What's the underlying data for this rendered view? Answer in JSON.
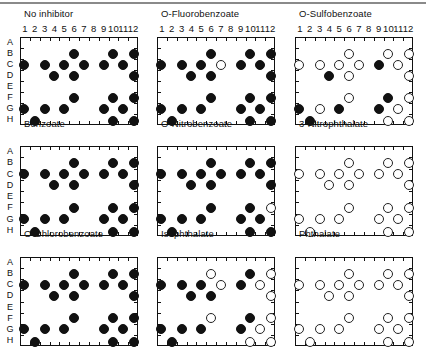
{
  "figure": {
    "rows": [
      "A",
      "B",
      "C",
      "D",
      "E",
      "F",
      "G",
      "H"
    ],
    "columns": [
      "1",
      "2",
      "3",
      "4",
      "5",
      "6",
      "7",
      "8",
      "9",
      "10",
      "11",
      "12"
    ],
    "legend": {
      "filled": "filled circle",
      "open": "open circle"
    },
    "colors": {
      "filled": "#111111",
      "open_border": "#222222",
      "background": "#ffffff"
    }
  },
  "chart_data": {
    "type": "scatter",
    "title": "",
    "xlabel": "",
    "ylabel": "",
    "x_tick_labels": [
      "1",
      "2",
      "3",
      "4",
      "5",
      "6",
      "7",
      "8",
      "9",
      "10",
      "11",
      "12"
    ],
    "y_tick_labels": [
      "A",
      "B",
      "C",
      "D",
      "E",
      "F",
      "G",
      "H"
    ],
    "grid": false,
    "wells": [
      "B6",
      "B10",
      "B12",
      "C1",
      "C3",
      "C5",
      "C7",
      "C9",
      "C11",
      "D4",
      "D6",
      "D12",
      "F6",
      "F10",
      "F12",
      "G1",
      "G3",
      "G5",
      "G9",
      "G11",
      "H2",
      "H10",
      "H12"
    ],
    "panels": [
      {
        "title": "No inhibitor",
        "show_col_labels": true,
        "show_row_labels": true,
        "filled": [
          "B6",
          "B10",
          "B12",
          "C1",
          "C3",
          "C5",
          "C7",
          "C9",
          "C11",
          "D4",
          "D6",
          "D12",
          "F6",
          "F10",
          "F12",
          "G1",
          "G3",
          "G5",
          "G9",
          "G11",
          "H2",
          "H10",
          "H12"
        ],
        "open": []
      },
      {
        "title": "O-Fluorobenzoate",
        "show_col_labels": true,
        "show_row_labels": false,
        "filled": [
          "B6",
          "B10",
          "B12",
          "C1",
          "C3",
          "C5",
          "C9",
          "C11",
          "D4",
          "D6",
          "D12",
          "F6",
          "F10",
          "F12",
          "G1",
          "G3",
          "G5",
          "G9",
          "G11",
          "H2",
          "H10",
          "H12"
        ],
        "open": [
          "C7"
        ]
      },
      {
        "title": "O-Sulfobenzoate",
        "show_col_labels": true,
        "show_row_labels": false,
        "filled": [
          "C9",
          "D4",
          "F10",
          "G1",
          "G5",
          "G9",
          "H2"
        ],
        "open": [
          "B6",
          "B10",
          "B12",
          "C1",
          "C3",
          "C5",
          "C7",
          "C11",
          "D6",
          "D12",
          "F6",
          "F12",
          "G3",
          "G11",
          "H10",
          "H12"
        ]
      },
      {
        "title": "Benzoate",
        "show_col_labels": false,
        "show_row_labels": true,
        "filled": [
          "B6",
          "B10",
          "B12",
          "C1",
          "C3",
          "C5",
          "C7",
          "C9",
          "C11",
          "D4",
          "D6",
          "D12",
          "F6",
          "F10",
          "F12",
          "G1",
          "G3",
          "G5",
          "G9",
          "G11",
          "H2",
          "H10",
          "H12"
        ],
        "open": []
      },
      {
        "title": "O-Nitrobenzoate",
        "show_col_labels": false,
        "show_row_labels": false,
        "filled": [
          "B6",
          "B10",
          "B12",
          "C1",
          "C3",
          "C5",
          "C7",
          "C9",
          "C11",
          "D4",
          "D6",
          "D12",
          "F6",
          "F10",
          "G1",
          "G3",
          "G5",
          "G9",
          "G11",
          "H2",
          "H10",
          "H12"
        ],
        "open": [
          "F12"
        ]
      },
      {
        "title": "3-Nitrophthalate",
        "show_col_labels": false,
        "show_row_labels": false,
        "filled": [],
        "open": [
          "B6",
          "B10",
          "B12",
          "C1",
          "C3",
          "C5",
          "C7",
          "C9",
          "C11",
          "D4",
          "D6",
          "D12",
          "F6",
          "F10",
          "F12",
          "G1",
          "G3",
          "G5",
          "G9",
          "G11",
          "H2",
          "H10",
          "H12"
        ]
      },
      {
        "title": "O-Chlorobenzoate",
        "show_col_labels": false,
        "show_row_labels": true,
        "filled": [
          "B6",
          "B10",
          "B12",
          "C1",
          "C3",
          "C5",
          "C7",
          "C9",
          "C11",
          "D4",
          "D6",
          "D12",
          "F6",
          "F10",
          "F12",
          "G1",
          "G3",
          "G5",
          "G9",
          "G11",
          "H2",
          "H10",
          "H12"
        ],
        "open": []
      },
      {
        "title": "Isophthalate",
        "show_col_labels": false,
        "show_row_labels": false,
        "filled": [
          "B10",
          "C1",
          "C3",
          "C5",
          "C9",
          "D4",
          "D6",
          "F10",
          "G1",
          "G3",
          "G5",
          "G9",
          "H2"
        ],
        "open": [
          "B6",
          "B12",
          "C7",
          "C11",
          "D12",
          "F6",
          "F12",
          "G11",
          "H10",
          "H12"
        ]
      },
      {
        "title": "Phthalate",
        "show_col_labels": false,
        "show_row_labels": false,
        "filled": [],
        "open": [
          "B6",
          "B10",
          "B12",
          "C1",
          "C3",
          "C5",
          "C7",
          "C9",
          "C11",
          "D4",
          "D6",
          "D12",
          "F6",
          "F10",
          "F12",
          "G1",
          "G3",
          "G5",
          "G9",
          "G11",
          "H2",
          "H10",
          "H12"
        ]
      }
    ]
  }
}
